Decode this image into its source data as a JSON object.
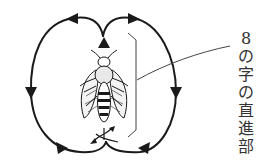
{
  "diagram": {
    "label": {
      "chars": [
        "8",
        "の",
        "字",
        "の",
        "直",
        "進",
        "部"
      ],
      "text": "8の字の直進部"
    },
    "colors": {
      "stroke": "#1a1a1a",
      "text": "#333333",
      "background": "#ffffff"
    }
  }
}
